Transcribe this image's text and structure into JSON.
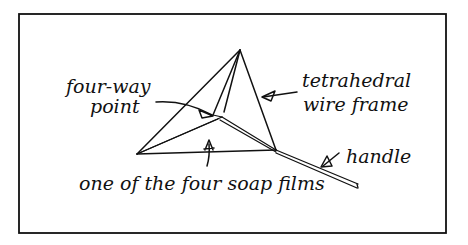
{
  "diagram": {
    "labels": {
      "four_way_line1": "four-way",
      "four_way_line2": "point",
      "tetra_line1": "tetrahedral",
      "tetra_line2": "wire frame",
      "handle": "handle",
      "soap_films": "one of the four soap films"
    },
    "colors": {
      "ink": "#111111",
      "background": "#ffffff"
    }
  }
}
